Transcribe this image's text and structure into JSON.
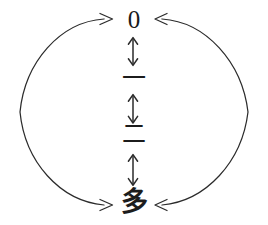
{
  "diagram": {
    "type": "cycle-with-ladder",
    "stroke_color": "#2b2b2b",
    "text_color": "#1a1a1a",
    "background_color": "#ffffff",
    "nodes": [
      {
        "id": "zero",
        "label": "0",
        "meaning": "zero",
        "y": 20
      },
      {
        "id": "one",
        "label": "一",
        "meaning": "one",
        "y": 78
      },
      {
        "id": "two",
        "label": "二",
        "meaning": "two",
        "y": 136
      },
      {
        "id": "many",
        "label": "多",
        "meaning": "many",
        "y": 202
      }
    ],
    "connectors": [
      {
        "id": "zero-one",
        "kind": "vertical-double-arrow",
        "glyph": "↕",
        "from": "zero",
        "to": "one"
      },
      {
        "id": "one-two",
        "kind": "vertical-double-arrow",
        "glyph": "↕",
        "from": "one",
        "to": "two"
      },
      {
        "id": "two-many",
        "kind": "vertical-double-arrow",
        "glyph": "↕",
        "from": "two",
        "to": "many"
      },
      {
        "id": "left-arc",
        "kind": "arc-double-arrow",
        "side": "left",
        "from": "many",
        "to": "zero",
        "arrowheads": [
          "top-outward-right",
          "bottom-outward-right"
        ]
      },
      {
        "id": "right-arc",
        "kind": "arc-double-arrow",
        "side": "right",
        "from": "zero",
        "to": "many",
        "arrowheads": [
          "top-inward-left",
          "bottom-inward-left"
        ]
      }
    ]
  }
}
